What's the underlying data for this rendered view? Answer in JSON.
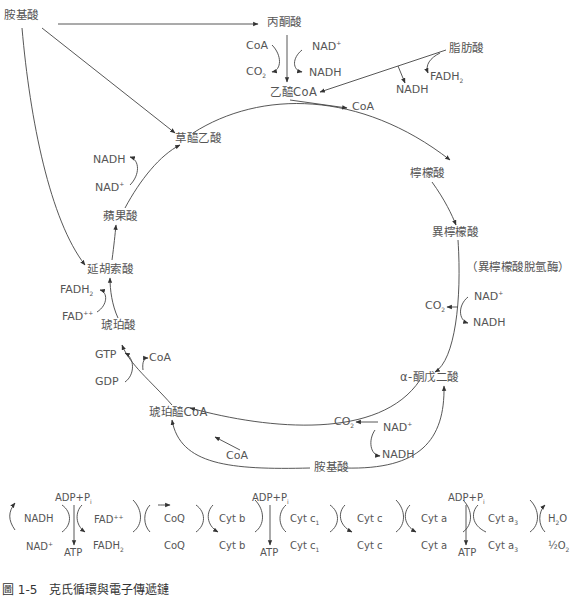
{
  "cycle": {
    "intermediates": {
      "oxaloacetate": "草醯乙酸",
      "citrate": "檸檬酸",
      "isocitrate": "異檸檬酸",
      "isocitrate_enzyme": "（異檸檬酸脫氫酶）",
      "alpha_ketoglutarate": "α-酮戊二酸",
      "succinyl_coa": "琥珀醯CoA",
      "succinate": "琥珀酸",
      "fumarate": "延胡索酸",
      "malate": "蘋果酸",
      "acetyl_coa": "乙醯CoA"
    },
    "inputs": {
      "amino_acid_top": "胺基酸",
      "amino_acid_bottom": "胺基酸",
      "pyruvate": "丙酮酸",
      "fatty_acid": "脂肪酸"
    },
    "cofactors": {
      "pyruvate_coa": "CoA",
      "pyruvate_co2": "CO",
      "pyruvate_nad": "NAD",
      "pyruvate_nadh": "NADH",
      "fatty_nadh": "NADH",
      "fatty_fadh2": "FADH",
      "acetyl_coa_out": "CoA",
      "malate_nadh": "NADH",
      "malate_nad": "NAD",
      "fumarate_fadh2": "FADH",
      "fumarate_fad": "FAD",
      "succinate_gtp": "GTP",
      "succinate_gdp": "GDP",
      "succinate_coa": "CoA",
      "isocitrate_co2": "CO",
      "isocitrate_nad": "NAD",
      "isocitrate_nadh": "NADH",
      "akg_co2": "CO",
      "akg_nad": "NAD",
      "akg_nadh": "NADH",
      "succinylcoa_coa": "CoA"
    }
  },
  "etc": {
    "pairs": [
      {
        "top": "NADH",
        "bottom": "NAD"
      },
      {
        "top": "FAD",
        "bottom": "FADH"
      },
      {
        "top": "CoQ",
        "bottom": "CoQ"
      },
      {
        "top": "Cyt b",
        "bottom": "Cyt b"
      },
      {
        "top": "Cyt c",
        "bottom": "Cyt c"
      },
      {
        "top": "Cyt c",
        "bottom": "Cyt c"
      },
      {
        "top": "Cyt a",
        "bottom": "Cyt a"
      },
      {
        "top": "Cyt a",
        "bottom": "Cyt a"
      },
      {
        "top": "H",
        "bottom": "½O"
      }
    ],
    "atp_sites": [
      {
        "top": "ADP+P",
        "bottom": "ATP"
      },
      {
        "top": "ADP+P",
        "bottom": "ATP"
      },
      {
        "top": "ADP+P",
        "bottom": "ATP"
      }
    ]
  },
  "caption": "圖 1-5　克氏循環與電子傳遞鏈"
}
